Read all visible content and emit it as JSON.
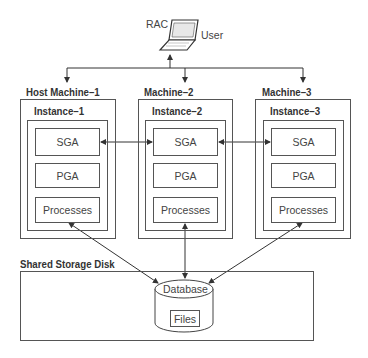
{
  "user": {
    "label": "User",
    "prefix": "RAC",
    "icon": "laptop-icon"
  },
  "machines": [
    {
      "label": "Host Machine–1",
      "instance": "Instance–1",
      "sga": "SGA",
      "pga": "PGA",
      "processes": "Processes"
    },
    {
      "label": "Machine–2",
      "instance": "Instance–2",
      "sga": "SGA",
      "pga": "PGA",
      "processes": "Processes"
    },
    {
      "label": "Machine–3",
      "instance": "Instance–3",
      "sga": "SGA",
      "pga": "PGA",
      "processes": "Processes"
    }
  ],
  "storage": {
    "label": "Shared Storage Disk",
    "database": "Database",
    "files": "Files"
  },
  "colors": {
    "line": "#444444",
    "border": "#555555",
    "text": "#333333"
  }
}
